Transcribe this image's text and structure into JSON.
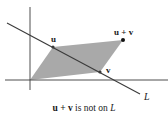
{
  "figure": {
    "origin": [
      30,
      80
    ],
    "axes": {
      "x_axis": {
        "from": [
          5,
          80
        ],
        "to": [
          168,
          80
        ]
      },
      "y_axis": {
        "from": [
          30,
          7
        ],
        "to": [
          30,
          90
        ]
      }
    },
    "points": {
      "u": {
        "label": "u",
        "pos": [
          53,
          47
        ]
      },
      "v": {
        "label": "v",
        "pos": [
          100,
          72
        ]
      },
      "u_plus_v": {
        "label": "u + v",
        "pos": [
          123,
          40
        ]
      }
    },
    "line_L": {
      "label": "L",
      "from": [
        7,
        23
      ],
      "to": [
        140,
        94
      ]
    },
    "colors": {
      "parallelogram_fill": "#a9a9a9",
      "line": "#3a3a3a",
      "axes": "#3a3a3a",
      "text": "#1a1a1a"
    }
  },
  "caption": {
    "part1": "u + v",
    "part2": " is not on ",
    "part3": "L"
  }
}
